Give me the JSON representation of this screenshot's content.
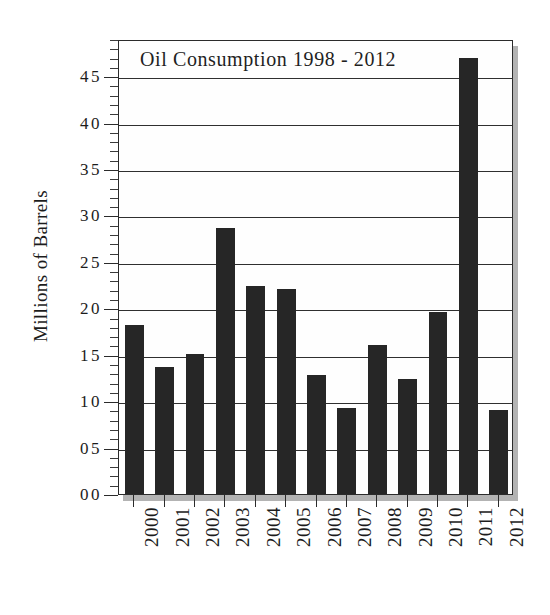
{
  "chart_data": {
    "type": "bar",
    "title": "Oil Consumption 1998 - 2012",
    "xlabel": "",
    "ylabel": "Millions of Barrels",
    "categories": [
      "2000",
      "2001",
      "2002",
      "2003",
      "2004",
      "2005",
      "2006",
      "2007",
      "2008",
      "2009",
      "2010",
      "2011",
      "2012"
    ],
    "values": [
      18.2,
      13.7,
      15.1,
      28.7,
      22.4,
      22.1,
      12.8,
      9.3,
      16.0,
      12.4,
      19.6,
      47.0,
      9.0
    ],
    "ylim": [
      0,
      49
    ],
    "ytick_labels": [
      "00",
      "05",
      "10",
      "15",
      "20",
      "25",
      "30",
      "35",
      "40",
      "45"
    ],
    "ytick_values": [
      0,
      5,
      10,
      15,
      20,
      25,
      30,
      35,
      40,
      45
    ],
    "minor_tick_interval": 1,
    "grid": "horizontal",
    "legend": "none",
    "bar_color": "#262626",
    "axis_color": "#2b2b2b",
    "background_color": "#fefefe"
  }
}
